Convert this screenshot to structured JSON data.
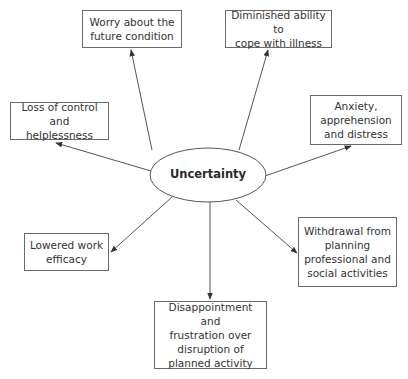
{
  "diagram": {
    "center": {
      "label": "Uncertainty",
      "cx": 208,
      "cy": 175,
      "rx": 58,
      "ry": 27
    },
    "nodes": [
      {
        "id": "worry",
        "label": "Worry about the\nfuture condition",
        "x": 82,
        "y": 10,
        "w": 100,
        "h": 38
      },
      {
        "id": "diminished",
        "label": "Diminished ability to\ncope with illness",
        "x": 225,
        "y": 10,
        "w": 107,
        "h": 38
      },
      {
        "id": "loss",
        "label": "Loss of control\nand helplessness",
        "x": 10,
        "y": 102,
        "w": 99,
        "h": 38
      },
      {
        "id": "anxiety",
        "label": "Anxiety,\napprehension\nand distress",
        "x": 310,
        "y": 95,
        "w": 92,
        "h": 50
      },
      {
        "id": "lowered",
        "label": "Lowered work\nefficacy",
        "x": 24,
        "y": 233,
        "w": 85,
        "h": 38
      },
      {
        "id": "withdrawal",
        "label": "Withdrawal from\nplanning\nprofessional and\nsocial activities",
        "x": 298,
        "y": 217,
        "w": 99,
        "h": 70
      },
      {
        "id": "disappointment",
        "label": "Disappointment and\nfrustration over\ndisruption of\nplanned activity",
        "x": 154,
        "y": 301,
        "w": 113,
        "h": 68
      }
    ],
    "edges": [
      {
        "to": "worry",
        "x1": 152,
        "y1": 150,
        "x2": 131,
        "y2": 50
      },
      {
        "to": "diminished",
        "x1": 239,
        "y1": 150,
        "x2": 268,
        "y2": 50
      },
      {
        "to": "loss",
        "x1": 151,
        "y1": 171,
        "x2": 56,
        "y2": 143
      },
      {
        "to": "anxiety",
        "x1": 265,
        "y1": 176,
        "x2": 351,
        "y2": 146
      },
      {
        "to": "lowered",
        "x1": 172,
        "y1": 197,
        "x2": 111,
        "y2": 252
      },
      {
        "to": "withdrawal",
        "x1": 236,
        "y1": 200,
        "x2": 297,
        "y2": 253
      },
      {
        "to": "disappointment",
        "x1": 210,
        "y1": 202,
        "x2": 210,
        "y2": 299
      }
    ],
    "colors": {
      "line": "#555555",
      "border": "#6a6a6a",
      "text": "#333333",
      "background": "#ffffff"
    }
  }
}
